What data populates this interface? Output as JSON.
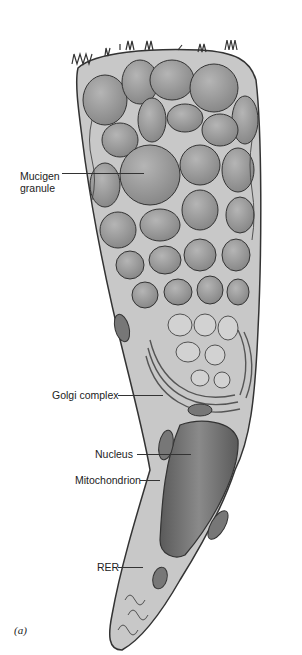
{
  "figure": {
    "type": "cell-illustration",
    "panel_label": "(a)",
    "colors": {
      "granule_fill": "#9a9a9a",
      "cytoplasm_fill": "#c8c8c8",
      "nucleus_fill": "#6e6e6e",
      "outline": "#333333",
      "background": "#ffffff"
    },
    "labels": [
      {
        "id": "mucigen",
        "line1": "Mucigen",
        "line2": "granule"
      },
      {
        "id": "golgi",
        "text": "Golgi complex"
      },
      {
        "id": "nucleus",
        "text": "Nucleus"
      },
      {
        "id": "mito",
        "text": "Mitochondrion"
      },
      {
        "id": "rer",
        "text": "RER"
      }
    ]
  }
}
